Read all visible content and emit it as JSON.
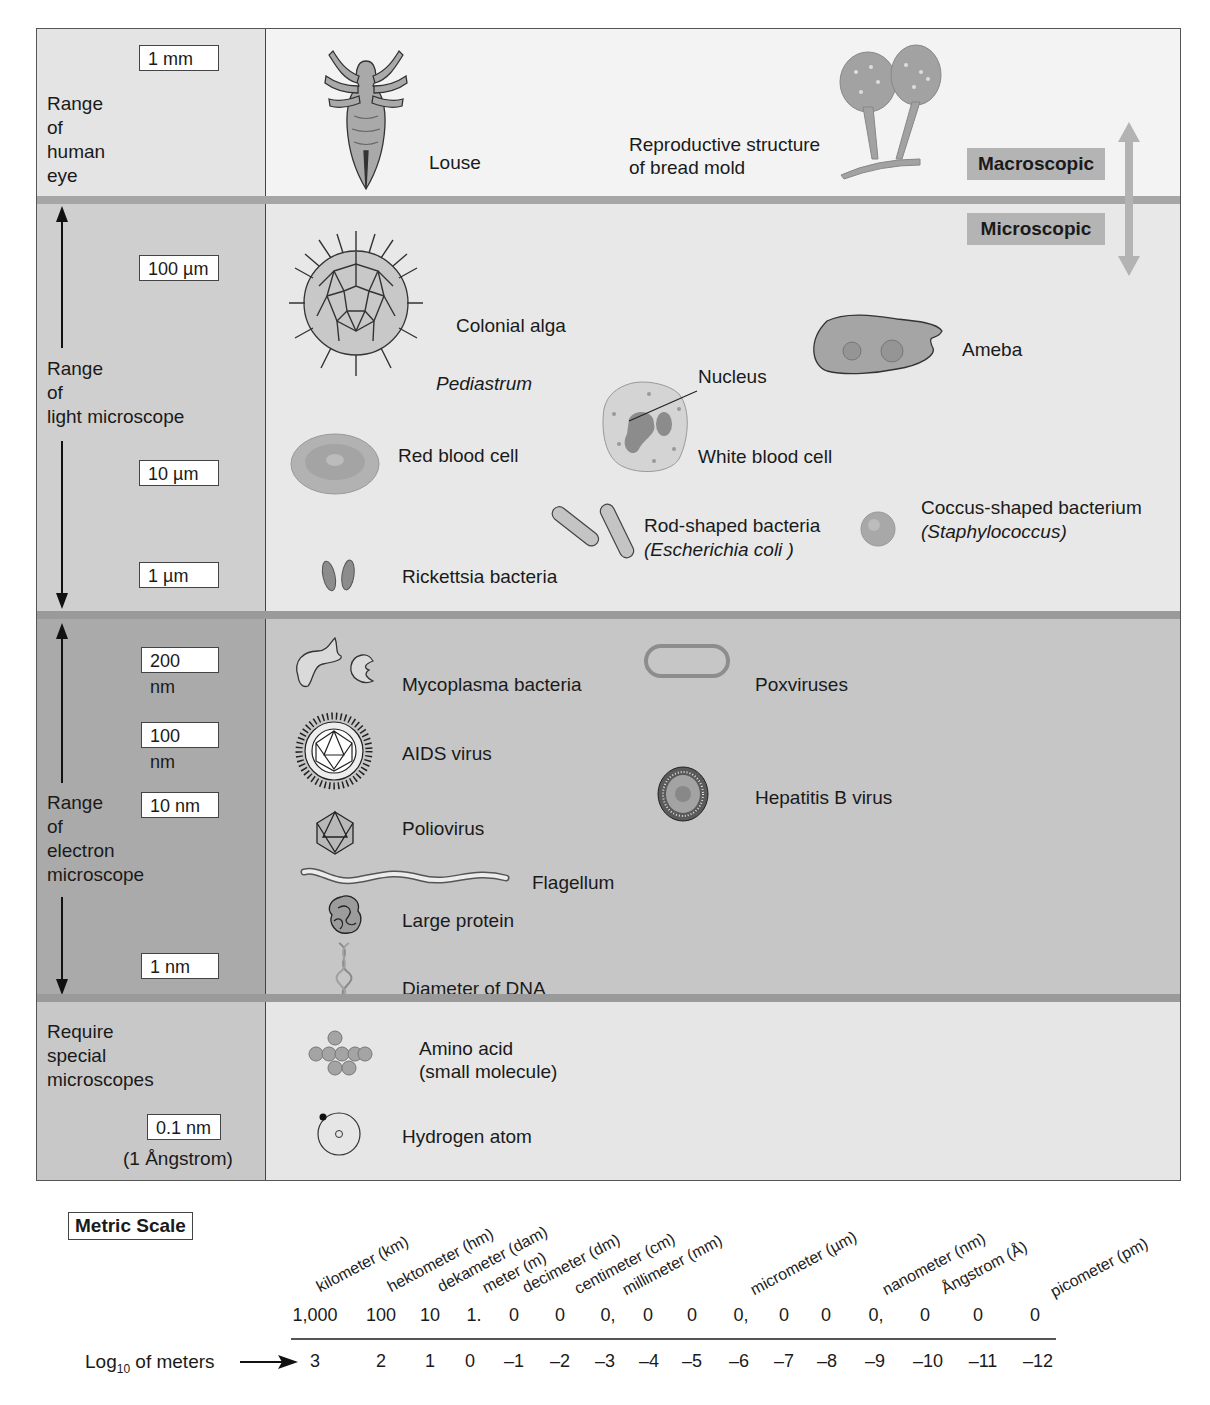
{
  "bands": {
    "eye": {
      "range_label": "Range\nof\nhuman\neye",
      "scale": [
        "1 mm"
      ]
    },
    "light": {
      "range_label": "Range\nof\nlight microscope",
      "scale": [
        "100 µm",
        "10 µm",
        "1 µm"
      ]
    },
    "electron": {
      "range_label": "Range\nof\nelectron\nmicroscope",
      "scale": [
        "200 nm",
        "100 nm",
        "10 nm",
        "1 nm"
      ]
    },
    "special": {
      "range_label": "Require\nspecial\nmicroscopes",
      "scale": [
        "0.1 nm"
      ],
      "note": "(1 Ångstrom)"
    }
  },
  "tags": {
    "macroscopic": "Macroscopic",
    "microscopic": "Microscopic"
  },
  "specimens": {
    "louse": "Louse",
    "bread_mold": "Reproductive structure\nof bread mold",
    "colonial_alga": "Colonial alga",
    "pediastrum": "Pediastrum",
    "ameba": "Ameba",
    "nucleus": "Nucleus",
    "red_blood_cell": "Red blood cell",
    "white_blood_cell": "White blood cell",
    "rod_bacteria": "Rod-shaped bacteria",
    "rod_bacteria_species": "(Escherichia coli )",
    "coccus": "Coccus-shaped bacterium",
    "coccus_species": "(Staphylococcus)",
    "rickettsia": "Rickettsia bacteria",
    "mycoplasma": "Mycoplasma bacteria",
    "poxviruses": "Poxviruses",
    "aids_virus": "AIDS virus",
    "hepatitis_b": "Hepatitis B virus",
    "poliovirus": "Poliovirus",
    "flagellum": "Flagellum",
    "large_protein": "Large protein",
    "dna": "Diameter of DNA",
    "amino_acid": "Amino acid\n(small molecule)",
    "hydrogen_atom": "Hydrogen atom"
  },
  "metric_scale": {
    "title": "Metric Scale",
    "log_label": "of meters",
    "log_prefix": "Log",
    "log_sub": "10",
    "units": [
      "kilometer (km)",
      "hektometer (hm)",
      "dekameter (dam)",
      "meter (m)",
      "decimeter (dm)",
      "centimeter (cm)",
      "millimeter (mm)",
      "micrometer (µm)",
      "nanometer (nm)",
      "Ångstrom (Å)",
      "picometer (pm)"
    ],
    "digits": [
      "1,000",
      "100",
      "10",
      "1.",
      "0",
      "0",
      "0,",
      "0",
      "0",
      "0,",
      "0",
      "0",
      "0,",
      "0",
      "0",
      "0"
    ],
    "logs": [
      "3",
      "2",
      "1",
      "0",
      "–1",
      "–2",
      "–3",
      "–4",
      "–5",
      "–6",
      "–7",
      "–8",
      "–9",
      "–10",
      "–11",
      "–12"
    ]
  }
}
